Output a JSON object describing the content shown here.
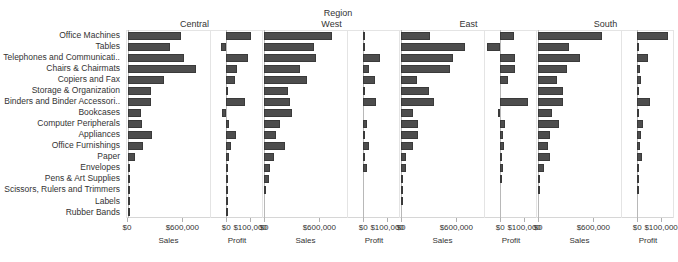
{
  "chart_data": {
    "type": "bar",
    "title": "Region",
    "orientation": "horizontal",
    "grid": false,
    "legend": "none",
    "panel_rows": "sub-category",
    "panel_cols": [
      "Region",
      "Measure Names"
    ],
    "categories": [
      "Office Machines",
      "Tables",
      "Telephones and Communicati..",
      "Chairs & Chairmats",
      "Copiers and Fax",
      "Storage & Organization",
      "Binders and Binder Accessori..",
      "Bookcases",
      "Computer Peripherals",
      "Appliances",
      "Office Furnishings",
      "Paper",
      "Envelopes",
      "Pens & Art Supplies",
      "Scissors, Rulers and Trimmers",
      "Labels",
      "Rubber Bands"
    ],
    "regions": [
      "Central",
      "West",
      "East",
      "South"
    ],
    "measures": [
      "Sales",
      "Profit"
    ],
    "axes": {
      "sales": {
        "label": "Sales",
        "ticks": [
          0,
          600000
        ],
        "ticklabels": [
          "$0",
          "$600,000"
        ],
        "min": 0,
        "max": 900000
      },
      "profit": {
        "label": "Profit",
        "ticks": [
          0,
          100000
        ],
        "ticklabels": [
          "$0",
          "$100,000"
        ],
        "min": -60000,
        "max": 150000
      }
    },
    "series": [
      {
        "region": "Central",
        "measure": "Sales",
        "values": [
          570000,
          455000,
          610000,
          735000,
          390000,
          245000,
          250000,
          145000,
          150000,
          265000,
          165000,
          75000,
          18000,
          14000,
          10000,
          6000,
          2000
        ]
      },
      {
        "region": "Central",
        "measure": "Profit",
        "values": [
          103000,
          -22000,
          92000,
          46000,
          36000,
          5000,
          78000,
          -17000,
          11000,
          42000,
          20000,
          10000,
          7000,
          2000,
          1500,
          1000,
          300
        ]
      },
      {
        "region": "West",
        "measure": "Sales",
        "values": [
          735000,
          540000,
          560000,
          395000,
          465000,
          260000,
          285000,
          300000,
          175000,
          135000,
          230000,
          105000,
          60000,
          50000,
          22000,
          0,
          0
        ]
      },
      {
        "region": "West",
        "measure": "Profit",
        "values": [
          4000,
          4000,
          70000,
          24000,
          49000,
          3000,
          53000,
          0,
          16000,
          8000,
          23000,
          4000,
          14000,
          0,
          0,
          0,
          0
        ]
      },
      {
        "region": "East",
        "measure": "Sales",
        "values": [
          315000,
          695000,
          560000,
          530000,
          170000,
          300000,
          355000,
          125000,
          185000,
          180000,
          125000,
          50000,
          55000,
          4000,
          3000,
          2000,
          0
        ]
      },
      {
        "region": "East",
        "measure": "Profit",
        "values": [
          56000,
          -54000,
          63000,
          60000,
          34000,
          0,
          115000,
          -11000,
          19000,
          12000,
          15000,
          5000,
          10000,
          2000,
          0,
          0,
          0
        ]
      },
      {
        "region": "South",
        "measure": "Sales",
        "values": [
          690000,
          335000,
          450000,
          310000,
          210000,
          275000,
          270000,
          155000,
          230000,
          125000,
          105000,
          135000,
          70000,
          18000,
          14000,
          0,
          0
        ]
      },
      {
        "region": "South",
        "measure": "Profit",
        "values": [
          131000,
          2000,
          44000,
          12000,
          17000,
          8000,
          52000,
          4000,
          22000,
          14000,
          13000,
          18000,
          7000,
          5000,
          1000,
          0,
          0
        ]
      }
    ]
  }
}
